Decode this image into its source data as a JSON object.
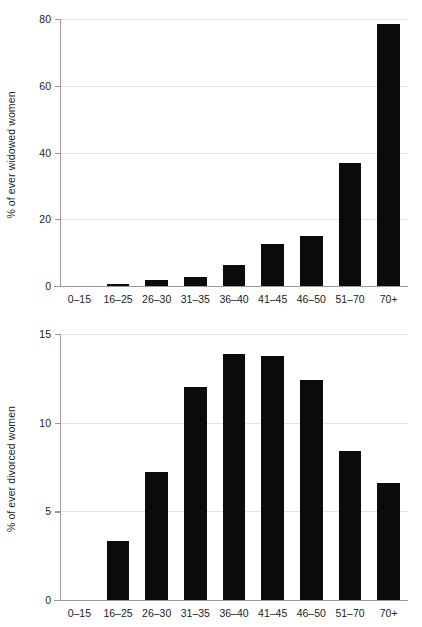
{
  "figure": {
    "background_color": "#ffffff",
    "bar_color": "#0b0b0b",
    "grid_color": "#e2e2e2",
    "axis_color": "#9a9a9a"
  },
  "chart_data": [
    {
      "type": "bar",
      "panel": "top",
      "title": "",
      "xlabel": "",
      "ylabel": "% of ever widowed women",
      "categories": [
        "0–15",
        "16–25",
        "26–30",
        "31–35",
        "36–40",
        "41–45",
        "46–50",
        "51–70",
        "70+"
      ],
      "values": [
        0,
        0.7,
        1.7,
        2.6,
        6.3,
        12.5,
        15.0,
        37.0,
        78.5
      ],
      "ylim": [
        0,
        80
      ],
      "yticks": [
        0,
        20,
        40,
        60,
        80
      ],
      "ytick_labels": [
        "0",
        "20",
        "40",
        "60",
        "80"
      ],
      "grid": true,
      "legend": "none"
    },
    {
      "type": "bar",
      "panel": "bottom",
      "title": "",
      "xlabel": "",
      "ylabel": "% of ever divorced women",
      "categories": [
        "0–15",
        "16–25",
        "26–30",
        "31–35",
        "36–40",
        "41–45",
        "46–50",
        "51–70",
        "70+"
      ],
      "values": [
        0,
        3.3,
        7.2,
        12.0,
        13.9,
        13.75,
        12.4,
        8.4,
        6.6
      ],
      "ylim": [
        0,
        15
      ],
      "yticks": [
        0,
        5,
        10,
        15
      ],
      "ytick_labels": [
        "0",
        "5",
        "10",
        "15"
      ],
      "grid": true,
      "legend": "none"
    }
  ]
}
